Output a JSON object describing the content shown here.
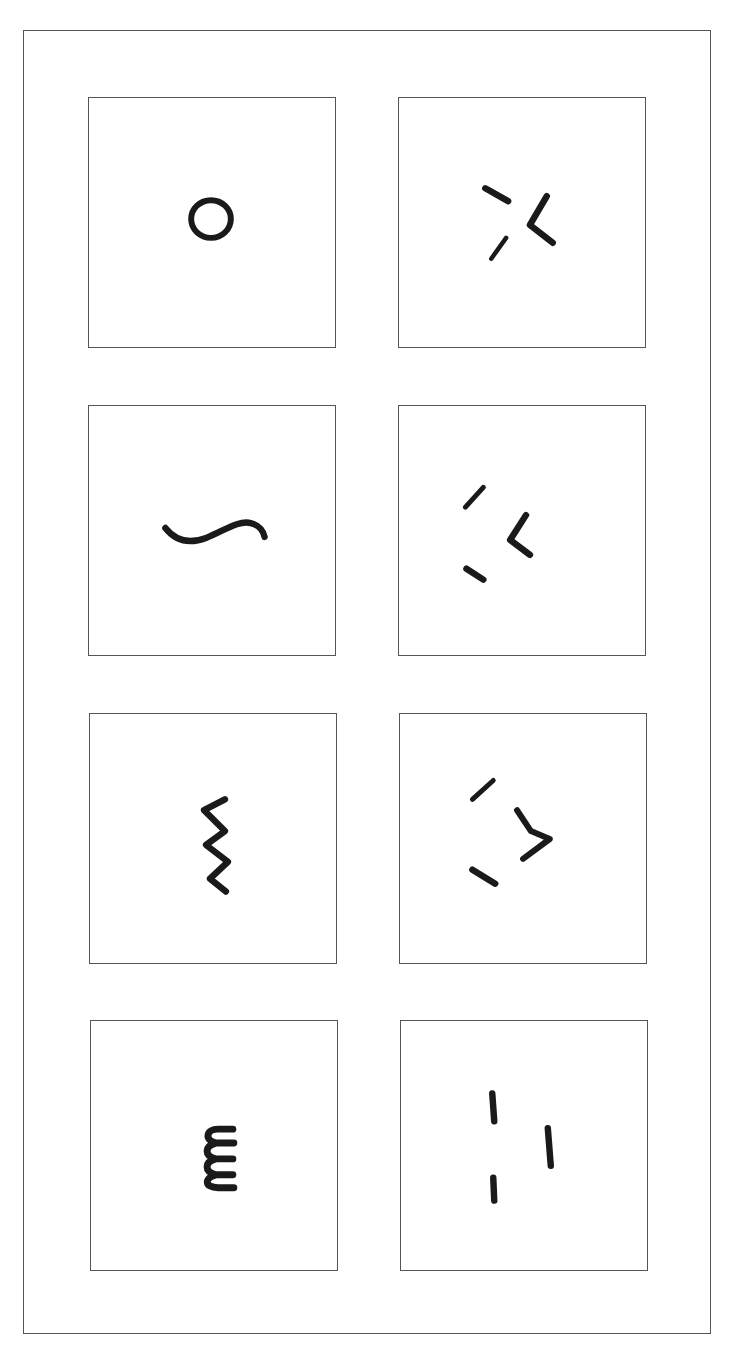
{
  "figure": {
    "layout": "4 rows x 2 columns of bordered panels inside an outer frame",
    "colors": {
      "border": "#555555",
      "stroke": "#1a1a1a",
      "background": "#ffffff"
    },
    "rows": [
      {
        "left": {
          "label": "circle",
          "description": "small closed circle"
        },
        "right": {
          "label": "scattered-strokes-with-angle",
          "description": "two short dashes and a '<'-shaped angle"
        }
      },
      {
        "left": {
          "label": "wave",
          "description": "single S-shaped tilde wave"
        },
        "right": {
          "label": "scattered-strokes-with-angle",
          "description": "two short dashes and a '<'-shaped angle"
        }
      },
      {
        "left": {
          "label": "zigzag",
          "description": "vertical zigzag line"
        },
        "right": {
          "label": "scattered-strokes-with-chevron",
          "description": "two short dashes and a '>'-shaped chevron"
        }
      },
      {
        "left": {
          "label": "coil",
          "description": "vertical coil resembling a sideways 'm' / epsilon"
        },
        "right": {
          "label": "vertical-bars",
          "description": "three short vertical bars"
        }
      }
    ]
  }
}
